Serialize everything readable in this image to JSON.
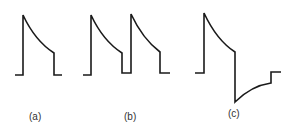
{
  "figure": {
    "panels": [
      {
        "id": "a",
        "label": "(a)",
        "description": "single exponentially decaying pulse"
      },
      {
        "id": "b",
        "label": "(b)",
        "description": "two consecutive decaying pulses"
      },
      {
        "id": "c",
        "label": "(c)",
        "description": "decaying pulse followed by negative undershoot recovering to baseline"
      }
    ],
    "colors": {
      "stroke": "#1a1a1a",
      "background": "#ffffff",
      "label": "#333333"
    }
  }
}
